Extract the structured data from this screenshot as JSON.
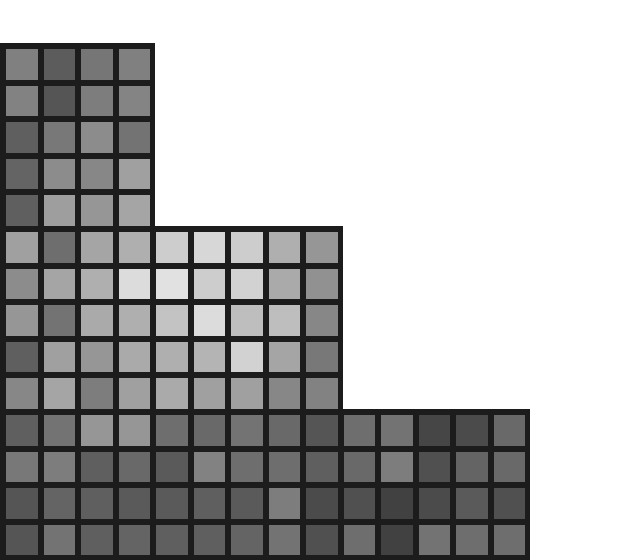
{
  "image": {
    "description": "Staircase-shaped grid of grayscale squares separated by thick dark borders on a white background",
    "background": "#ffffff",
    "border_color": "#1c1c1c",
    "col_pitch": 37.5,
    "row_pitch": 36.6,
    "origin_x": 0,
    "origin_y": 43,
    "border_width": 5
  },
  "blocks": [
    {
      "name": "top-block",
      "col_start": 0,
      "row_start": 0,
      "cols": 4,
      "rows": 5,
      "grays": [
        [
          128,
          92,
          118,
          128
        ],
        [
          130,
          85,
          125,
          132
        ],
        [
          95,
          120,
          140,
          115
        ],
        [
          100,
          140,
          135,
          160
        ],
        [
          95,
          158,
          150,
          165
        ]
      ]
    },
    {
      "name": "middle-block",
      "col_start": 0,
      "row_start": 5,
      "cols": 9,
      "rows": 5,
      "grays": [
        [
          160,
          110,
          165,
          175,
          205,
          215,
          205,
          175,
          150
        ],
        [
          140,
          165,
          175,
          220,
          225,
          205,
          210,
          170,
          145
        ],
        [
          150,
          115,
          170,
          175,
          195,
          220,
          190,
          190,
          135
        ],
        [
          95,
          160,
          150,
          170,
          175,
          180,
          210,
          165,
          120
        ],
        [
          135,
          165,
          125,
          160,
          170,
          160,
          160,
          135,
          130
        ]
      ]
    },
    {
      "name": "bottom-block",
      "col_start": 0,
      "row_start": 10,
      "cols": 14,
      "rows": 4,
      "grays": [
        [
          95,
          115,
          150,
          150,
          110,
          105,
          115,
          105,
          85,
          110,
          115,
          70,
          75,
          105
        ],
        [
          120,
          125,
          95,
          105,
          90,
          130,
          110,
          110,
          95,
          105,
          125,
          80,
          100,
          105
        ],
        [
          85,
          100,
          95,
          90,
          90,
          95,
          90,
          125,
          75,
          80,
          65,
          75,
          90,
          80
        ],
        [
          85,
          115,
          95,
          100,
          95,
          95,
          100,
          115,
          80,
          110,
          65,
          115,
          110,
          110
        ]
      ]
    }
  ]
}
